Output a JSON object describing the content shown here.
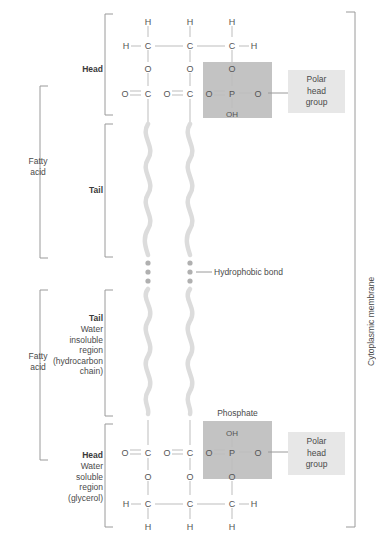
{
  "figure": {
    "type": "diagram",
    "colors": {
      "phosphate_box": "#c3c3c3",
      "polar_head_box": "#e7e7e7",
      "tail_line": "#dcdcdc",
      "bond_line": "#bdbdbd",
      "bracket_line": "#9a9a9a",
      "text": "#4a4a4a",
      "background": "#ffffff"
    }
  },
  "left_labels": {
    "fatty_acid_top": "Fatty\nacid",
    "fatty_acid_bottom": "Fatty\nacid",
    "head_top": "Head",
    "tail_top": "Tail",
    "tail_bottom_bold": "Tail",
    "tail_bottom_lines": "Water\ninsoluble\nregion\n(hydrocarbon\nchain)",
    "head_bottom_bold": "Head",
    "head_bottom_lines": "Water\nsoluble\nregion\n(glycerol)"
  },
  "annotations": {
    "hydrophobic_bond": "Hydrophobic bond",
    "phosphate": "Phosphate",
    "cytoplasmic_membrane": "Cytoplasmic membrane",
    "polar_head_group_top": "Polar\nhead\ngroup",
    "polar_head_group_bottom": "Polar\nhead\ngroup"
  },
  "top_leaflet": {
    "row_h_top": [
      "H",
      "H",
      "H"
    ],
    "row_backbone": [
      "H",
      "C",
      "C",
      "C",
      "H"
    ],
    "row_o_link": [
      "O",
      "O",
      "O"
    ],
    "row_carbonyl": [
      "O",
      "C",
      "O",
      "C",
      "O",
      "P",
      "O"
    ],
    "phosphate_bottom": "OH"
  },
  "bottom_leaflet": {
    "phosphate_top": "OH",
    "row_carbonyl": [
      "O",
      "C",
      "O",
      "C",
      "O",
      "P",
      "O"
    ],
    "row_o_link": [
      "O",
      "O",
      "O"
    ],
    "row_backbone": [
      "H",
      "C",
      "C",
      "C",
      "H"
    ],
    "row_h_bottom": [
      "H",
      "H",
      "H"
    ]
  },
  "structure": {
    "chain_x": [
      148,
      190,
      232
    ],
    "dot_rows_y": [
      263,
      272,
      281
    ],
    "tail_count": 4
  }
}
